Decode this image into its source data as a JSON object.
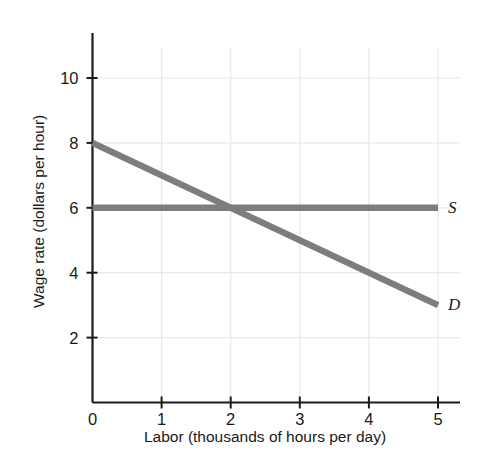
{
  "figure": {
    "top_cut_text": "pply",
    "background_color": "#ffffff"
  },
  "chart_data": {
    "type": "line",
    "title": "",
    "xlabel": "Labor (thousands of hours per day)",
    "ylabel": "Wage rate (dollars per hour)",
    "xlim": [
      0,
      5
    ],
    "ylim": [
      0,
      11
    ],
    "xticks": [
      0,
      1,
      2,
      3,
      4,
      5
    ],
    "xtick_labels": [
      "0",
      "1",
      "2",
      "3",
      "4",
      "5"
    ],
    "yticks": [
      2,
      4,
      6,
      8,
      10
    ],
    "ytick_labels": [
      "2",
      "4",
      "6",
      "8",
      "10"
    ],
    "grid": true,
    "grid_color": "#e8e8e8",
    "legend_position": "inline-right",
    "line_color": "#7d7d7d",
    "axis_color": "#1a1a1a",
    "series": [
      {
        "name": "S",
        "label": "S",
        "description": "Supply of labor (perfectly elastic at wage 6)",
        "color": "#7d7d7d",
        "points": [
          {
            "x": 0,
            "y": 6
          },
          {
            "x": 5,
            "y": 6
          }
        ]
      },
      {
        "name": "D",
        "label": "D",
        "description": "Demand for labor (downward sloping)",
        "color": "#7d7d7d",
        "points": [
          {
            "x": 0,
            "y": 8
          },
          {
            "x": 5,
            "y": 3
          }
        ]
      }
    ],
    "annotations": [
      {
        "name": "equilibrium",
        "x": 2,
        "y": 6,
        "description": "Intersection of supply and demand"
      }
    ]
  }
}
